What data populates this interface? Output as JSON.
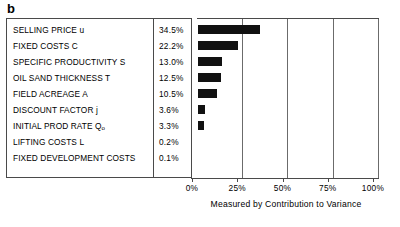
{
  "figure": {
    "panel_letter": "b",
    "axis_title": "Measured by Contribution to Variance",
    "x_tick_labels": [
      "0%",
      "25%",
      "50%",
      "75%",
      "100%"
    ],
    "bar_color": "#111111",
    "border_color": "#4a4a4a"
  },
  "chart_data": {
    "type": "bar",
    "orientation": "horizontal",
    "title": "",
    "subtitle": "",
    "xlabel": "Measured by Contribution to Variance",
    "ylabel": "",
    "xlim": [
      0,
      100
    ],
    "xticks": [
      0,
      25,
      50,
      75,
      100
    ],
    "xtick_labels": [
      "0%",
      "25%",
      "50%",
      "75%",
      "100%"
    ],
    "grid": "vertical gridlines at 25%, 50%, 75%, 100%",
    "legend": "none",
    "units": "percent",
    "categories": [
      "SELLING PRICE u",
      "FIXED COSTS C",
      "SPECIFIC PRODUCTIVITY S",
      "OIL SAND THICKNESS T",
      "FIELD ACREAGE A",
      "DISCOUNT FACTOR j",
      "INITIAL PROD RATE Qo",
      "LIFTING COSTS L",
      "FIXED DEVELOPMENT COSTS"
    ],
    "values": [
      34.5,
      22.2,
      13.0,
      12.5,
      10.5,
      3.6,
      3.3,
      0.2,
      0.1
    ],
    "value_labels": [
      "34.5%",
      "22.2%",
      "13.0%",
      "12.5%",
      "10.5%",
      "3.6%",
      "3.3%",
      "0.2%",
      "0.1%"
    ],
    "rows": [
      {
        "label_main": "SELLING PRICE u",
        "label_base": "SELLING PRICE u",
        "label_sub": "",
        "pct": "34.5%",
        "value": 34.5
      },
      {
        "label_main": "FIXED COSTS C",
        "label_base": "FIXED COSTS C",
        "label_sub": "",
        "pct": "22.2%",
        "value": 22.2
      },
      {
        "label_main": "SPECIFIC PRODUCTIVITY S",
        "label_base": "SPECIFIC PRODUCTIVITY S",
        "label_sub": "",
        "pct": "13.0%",
        "value": 13.0
      },
      {
        "label_main": "OIL SAND THICKNESS T",
        "label_base": "OIL SAND THICKNESS T",
        "label_sub": "",
        "pct": "12.5%",
        "value": 12.5
      },
      {
        "label_main": "FIELD ACREAGE A",
        "label_base": "FIELD ACREAGE A",
        "label_sub": "",
        "pct": "10.5%",
        "value": 10.5
      },
      {
        "label_main": "DISCOUNT FACTOR j",
        "label_base": "DISCOUNT FACTOR j",
        "label_sub": "",
        "pct": "3.6%",
        "value": 3.6
      },
      {
        "label_main": "INITIAL PROD RATE Qo",
        "label_base": "INITIAL PROD RATE Q",
        "label_sub": "o",
        "pct": "3.3%",
        "value": 3.3
      },
      {
        "label_main": "LIFTING COSTS L",
        "label_base": "LIFTING COSTS L",
        "label_sub": "",
        "pct": "0.2%",
        "value": 0.2
      },
      {
        "label_main": "FIXED DEVELOPMENT COSTS",
        "label_base": "FIXED DEVELOPMENT COSTS",
        "label_sub": "",
        "pct": "0.1%",
        "value": 0.1
      }
    ]
  }
}
